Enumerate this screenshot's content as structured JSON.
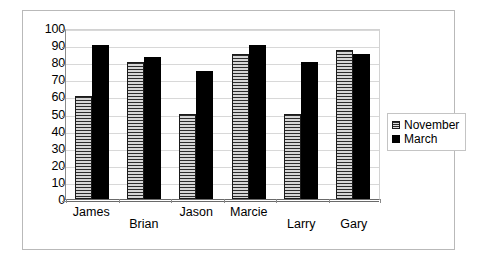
{
  "chart_data": {
    "type": "bar",
    "title": "",
    "subtitle": "",
    "xlabel": "",
    "ylabel": "",
    "categories": [
      "James",
      "Brian",
      "Jason",
      "Marcie",
      "Larry",
      "Gary"
    ],
    "series": [
      {
        "name": "November",
        "values": [
          60,
          80,
          50,
          85,
          50,
          87
        ],
        "color": "#bdbdbd",
        "fill": "horizontal-hatch"
      },
      {
        "name": "March",
        "values": [
          90,
          83,
          75,
          90,
          80,
          85
        ],
        "color": "#000000",
        "fill": "solid"
      }
    ],
    "ylim": [
      0,
      100
    ],
    "ytick_step": 10,
    "yticks": [
      0,
      10,
      20,
      30,
      40,
      50,
      60,
      70,
      80,
      90,
      100
    ],
    "grid": true,
    "grid_axis": "y",
    "legend_position": "right",
    "legend_entries": [
      "November",
      "March"
    ],
    "category_label_stagger": [
      "hi",
      "lo",
      "hi",
      "hi",
      "lo",
      "lo"
    ]
  },
  "colors": {
    "frame": "#b9b9b9",
    "axis": "#6a6a6a",
    "grid": "#d8d8d8",
    "series_november": "#bdbdbd",
    "series_march": "#000000",
    "text": "#000000",
    "background": "#ffffff"
  }
}
